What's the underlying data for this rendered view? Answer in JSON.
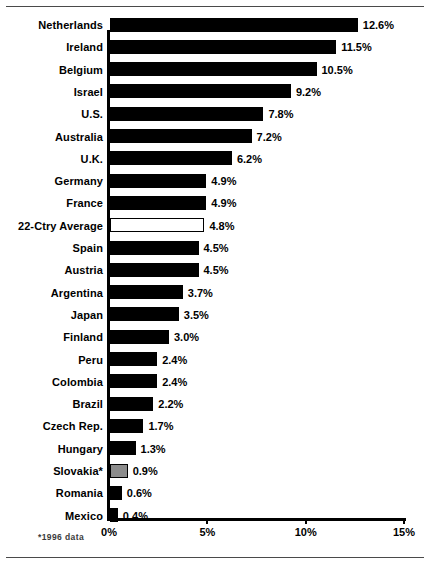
{
  "chart_data": {
    "type": "bar",
    "orientation": "horizontal",
    "title": "",
    "xlabel": "",
    "ylabel": "",
    "xlim": [
      0,
      15
    ],
    "grid": false,
    "legend": null,
    "tick_labels": [
      "0%",
      "5%",
      "10%",
      "15%"
    ],
    "tick_values": [
      0,
      5,
      10,
      15
    ],
    "value_suffix": "%",
    "categories": [
      "Netherlands",
      "Ireland",
      "Belgium",
      "Israel",
      "U.S.",
      "Australia",
      "U.K.",
      "Germany",
      "France",
      "22-Ctry Average",
      "Spain",
      "Austria",
      "Argentina",
      "Japan",
      "Finland",
      "Peru",
      "Colombia",
      "Brazil",
      "Czech Rep.",
      "Hungary",
      "Slovakia*",
      "Romania",
      "Mexico"
    ],
    "values": [
      12.6,
      11.5,
      10.5,
      9.2,
      7.8,
      7.2,
      6.2,
      4.9,
      4.9,
      4.8,
      4.5,
      4.5,
      3.7,
      3.5,
      3.0,
      2.4,
      2.4,
      2.2,
      1.7,
      1.3,
      0.9,
      0.6,
      0.4
    ],
    "value_labels": [
      "12.6%",
      "11.5%",
      "10.5%",
      "9.2%",
      "7.8%",
      "7.2%",
      "6.2%",
      "4.9%",
      "4.9%",
      "4.8%",
      "4.5%",
      "4.5%",
      "3.7%",
      "3.5%",
      "3.0%",
      "2.4%",
      "2.4%",
      "2.2%",
      "1.7%",
      "1.3%",
      "0.9%",
      "0.6%",
      "0.4%"
    ],
    "bar_styles": [
      "filled",
      "filled",
      "filled",
      "filled",
      "filled",
      "filled",
      "filled",
      "filled",
      "filled",
      "outline",
      "filled",
      "filled",
      "filled",
      "filled",
      "filled",
      "filled",
      "filled",
      "filled",
      "filled",
      "filled",
      "gray",
      "filled",
      "filled"
    ],
    "colors": {
      "bar_filled": "#000000",
      "bar_outline_fill": "#ffffff",
      "bar_gray_fill": "#8c8c8c",
      "bar_border": "#000000",
      "axis": "#000000",
      "text": "#000000",
      "rule": "#4a4a4a"
    }
  },
  "footnote": "*1996 data"
}
